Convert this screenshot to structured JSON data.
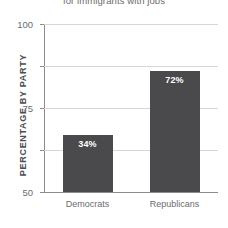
{
  "chart_data": {
    "type": "bar",
    "title": "for immigrants with jobs",
    "xlabel": "",
    "ylabel": "PERCENTAGE BY PARTY",
    "categories": [
      "Democrats",
      "Republicans"
    ],
    "values": [
      34,
      72
    ],
    "value_labels": [
      "34%",
      "72%"
    ],
    "ylim": [
      0,
      100
    ],
    "yticks": [
      0,
      25,
      50,
      75,
      100
    ],
    "ytick_labels": [
      "0",
      "25",
      "50",
      "75",
      "100"
    ],
    "grid": true,
    "legend": false,
    "series": [
      {
        "name": "Percentage by party",
        "values": [
          34,
          72
        ],
        "color": "#4a4a4c"
      }
    ],
    "colors": {
      "bar": "#4a4a4c",
      "gridline": "#d6d6d8",
      "axis": "#8c8c8e",
      "text": "#6c6c6e",
      "value_label": "#ffffff",
      "background": "#ffffff"
    }
  }
}
